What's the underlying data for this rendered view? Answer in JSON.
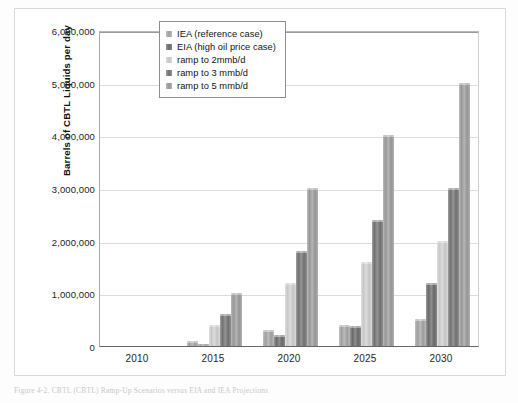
{
  "figure": {
    "caption": "Figure 4-2. CBTL (CBTL) Ramp-Up Scenarios versus EIA and IEA Projections"
  },
  "chart_data": {
    "type": "bar",
    "title": "",
    "subtitle": "",
    "xlabel": "",
    "ylabel": "Barrels of CBTL Liquids per day",
    "categories": [
      "2010",
      "2015",
      "2020",
      "2025",
      "2030"
    ],
    "ylim": [
      0,
      6000000
    ],
    "ytick_labels": [
      "6,000,000",
      "5,000,000",
      "4,000,000",
      "3,000,000",
      "2,000,000",
      "1,000,000",
      "0"
    ],
    "ytick_values": [
      6000000,
      5000000,
      4000000,
      3000000,
      2000000,
      1000000,
      0
    ],
    "grid": true,
    "legend_position": "inside-top-center",
    "series": [
      {
        "name": "IEA (reference case)",
        "color": "#a8a8a8",
        "values": [
          0,
          100000,
          300000,
          400000,
          520000
        ]
      },
      {
        "name": "EIA (high oil price case)",
        "color": "#6f6f6f",
        "values": [
          0,
          30000,
          200000,
          380000,
          1200000
        ]
      },
      {
        "name": "ramp to 2mmb/d",
        "color": "#d2d2d2",
        "values": [
          0,
          400000,
          1200000,
          1600000,
          2000000
        ]
      },
      {
        "name": "ramp to 3 mmb/d",
        "color": "#777777",
        "values": [
          0,
          600000,
          1800000,
          2400000,
          3000000
        ]
      },
      {
        "name": "ramp to 5 mmb/d",
        "color": "#9f9f9f",
        "values": [
          0,
          1000000,
          3000000,
          4000000,
          5000000
        ]
      }
    ]
  }
}
